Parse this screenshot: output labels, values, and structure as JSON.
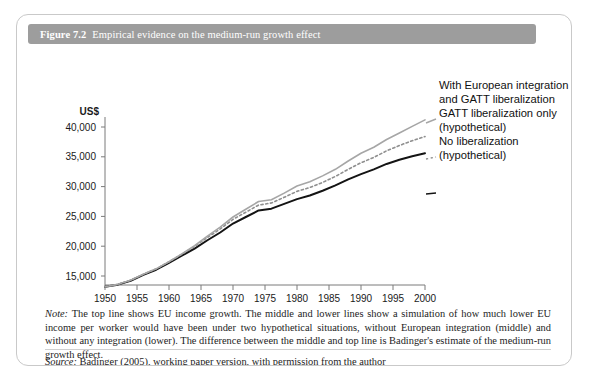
{
  "figure": {
    "number": "Figure 7.2",
    "title": "Empirical evidence on the medium-run growth effect"
  },
  "note": {
    "lead": "Note:",
    "text": " The top line shows EU income growth. The middle and lower lines show a simulation of how much lower EU income per worker would have been under two hypothetical situations, without European integration (middle) and without any integration (lower). The difference between the middle and top line is Badinger's estimate of the medium-run growth effect."
  },
  "source": {
    "lead": "Source:",
    "text": " Badinger (2005), working paper version, with permission from the author"
  },
  "legend": {
    "top_line_1": "With European integration",
    "top_line_2": "and GATT liberalization",
    "mid_line_1": "GATT liberalization only",
    "mid_line_2": "(hypothetical)",
    "bot_line_1": "No liberalization",
    "bot_line_2": "(hypothetical)"
  },
  "colors": {
    "title_bar": "#9d9d9d",
    "border": "#c9c9c9",
    "series_top": "#a6a6a6",
    "series_mid": "#8f8f8f",
    "series_bottom": "#141414",
    "axis": "#7a7a7a"
  },
  "chart_data": {
    "type": "line",
    "title": "Empirical evidence on the medium-run growth effect",
    "xlabel": "",
    "ylabel": "US$",
    "y_unit_label": "US$",
    "xlim": [
      1950,
      2000
    ],
    "ylim": [
      12000,
      42000
    ],
    "grid": false,
    "legend_position": "right",
    "xticks": [
      1950,
      1955,
      1960,
      1965,
      1970,
      1975,
      1980,
      1985,
      1990,
      1995,
      2000
    ],
    "xtick_labels": [
      "1950",
      "1955",
      "1960",
      "1965",
      "1970",
      "1975",
      "1980",
      "1985",
      "1990",
      "1995",
      "2000"
    ],
    "yticks": [
      15000,
      20000,
      25000,
      30000,
      35000,
      40000
    ],
    "ytick_labels": [
      "15,000",
      "20,000",
      "25,000",
      "30,000",
      "35,000",
      "40,000"
    ],
    "x": [
      1950,
      1952,
      1954,
      1956,
      1958,
      1960,
      1962,
      1964,
      1966,
      1968,
      1970,
      1972,
      1974,
      1976,
      1978,
      1980,
      1982,
      1984,
      1986,
      1988,
      1990,
      1992,
      1994,
      1996,
      1998,
      2000
    ],
    "series": [
      {
        "name": "With European integration and GATT liberalization",
        "style": "solid",
        "color": "#a6a6a6",
        "values": [
          13200,
          13600,
          14300,
          15300,
          16200,
          17400,
          18700,
          20100,
          21700,
          23200,
          24900,
          26200,
          27500,
          27800,
          28900,
          30100,
          30800,
          31800,
          32900,
          34300,
          35600,
          36600,
          37900,
          39000,
          40100,
          41200
        ]
      },
      {
        "name": "GATT liberalization only (hypothetical)",
        "style": "dotted",
        "color": "#8f8f8f",
        "values": [
          13200,
          13600,
          14300,
          15300,
          16200,
          17400,
          18650,
          19950,
          21450,
          22900,
          24500,
          25700,
          26900,
          27250,
          28200,
          29200,
          29850,
          30700,
          31700,
          32900,
          34000,
          34900,
          36000,
          36900,
          37700,
          38400
        ]
      },
      {
        "name": "No liberalization (hypothetical)",
        "style": "solid",
        "color": "#141414",
        "values": [
          13200,
          13550,
          14200,
          15200,
          16050,
          17200,
          18400,
          19600,
          21000,
          22300,
          23800,
          24900,
          26000,
          26300,
          27100,
          27900,
          28500,
          29300,
          30200,
          31200,
          32100,
          32900,
          33800,
          34500,
          35100,
          35600
        ]
      }
    ]
  }
}
